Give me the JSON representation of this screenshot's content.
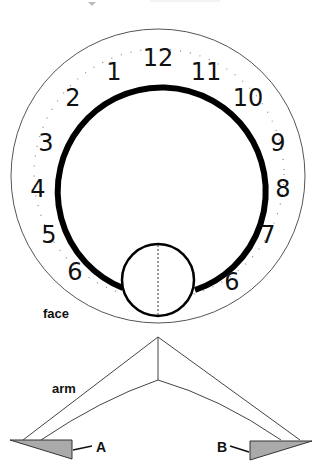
{
  "face": {
    "label": "face",
    "numerals": [
      {
        "text": "1",
        "x": 114,
        "y": 80
      },
      {
        "text": "12",
        "x": 158,
        "y": 66
      },
      {
        "text": "11",
        "x": 206,
        "y": 80
      },
      {
        "text": "2",
        "x": 73,
        "y": 106
      },
      {
        "text": "10",
        "x": 248,
        "y": 106
      },
      {
        "text": "3",
        "x": 46,
        "y": 151
      },
      {
        "text": "9",
        "x": 278,
        "y": 151
      },
      {
        "text": "4",
        "x": 38,
        "y": 197
      },
      {
        "text": "8",
        "x": 283,
        "y": 197
      },
      {
        "text": "5",
        "x": 49,
        "y": 243
      },
      {
        "text": "7",
        "x": 268,
        "y": 243
      },
      {
        "text": "6",
        "x": 75,
        "y": 280
      },
      {
        "text": "6",
        "x": 232,
        "y": 290
      }
    ]
  },
  "arm": {
    "label": "arm"
  },
  "markers": {
    "a": "A",
    "b": "B"
  },
  "colors": {
    "stroke": "#111111",
    "thin_stroke": "#555555",
    "tab_fill": "#aaaaaa"
  }
}
